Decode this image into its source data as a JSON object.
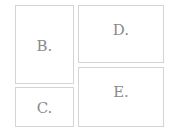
{
  "boxes": {
    "b": {
      "label": "B."
    },
    "c": {
      "label": "C."
    },
    "d": {
      "label": "D."
    },
    "e": {
      "label": "E."
    }
  }
}
